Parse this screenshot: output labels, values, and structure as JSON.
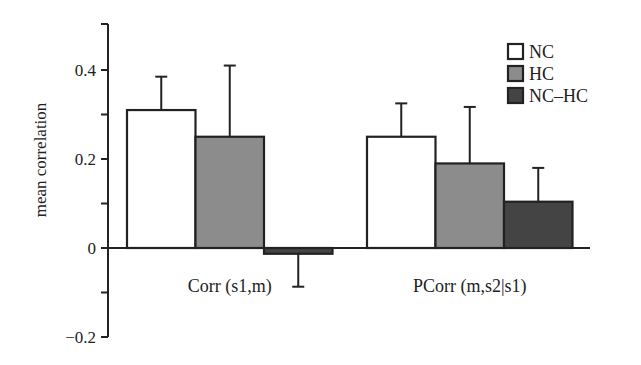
{
  "chart_data": {
    "type": "bar",
    "title": "",
    "xlabel": "",
    "ylabel": "mean correlation",
    "ylim": [
      -0.2,
      0.5
    ],
    "yticks": [
      -0.2,
      -0.1,
      0,
      0.1,
      0.2,
      0.3,
      0.4
    ],
    "ytick_labels": [
      "−0.2",
      "",
      "0",
      "",
      "0.2",
      "",
      "0.4"
    ],
    "categories": [
      "Corr (s1,m)",
      "PCorr (m,s2|s1)"
    ],
    "series": [
      {
        "name": "NC",
        "color": "#ffffff",
        "values": [
          0.31,
          0.25
        ],
        "error_upper": [
          0.385,
          0.325
        ]
      },
      {
        "name": "HC",
        "color": "#8c8c8c",
        "values": [
          0.25,
          0.19
        ],
        "error_upper": [
          0.41,
          0.317
        ]
      },
      {
        "name": "NC–HC",
        "color": "#444444",
        "values": [
          -0.013,
          0.104
        ],
        "error_upper": [
          -0.087,
          0.18
        ]
      }
    ],
    "legend": {
      "position": "upper right",
      "entries": [
        "NC",
        "HC",
        "NC–HC"
      ]
    },
    "grid": false
  }
}
